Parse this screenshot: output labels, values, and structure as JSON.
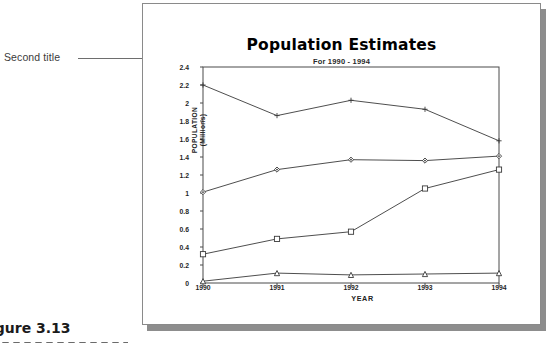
{
  "annotation": {
    "label": "Second title",
    "leader_icon": "arrow-right-icon"
  },
  "figure": {
    "caption": "igure 3.13"
  },
  "chart_data": {
    "type": "line",
    "title": "Population Estimates",
    "subtitle": "For 1990 - 1994",
    "xlabel": "YEAR",
    "ylabel": "POPULATION",
    "ylabel_sub": "(Millions)",
    "categories": [
      "1990",
      "1991",
      "1992",
      "1993",
      "1994"
    ],
    "ylim": [
      0,
      2.4
    ],
    "yticks": [
      "0",
      "0.2",
      "0.4",
      "0.6",
      "0.8",
      "1",
      "1.2",
      "1.4",
      "1.6",
      "1.8",
      "2",
      "2.2",
      "2.4"
    ],
    "ytick_values": [
      0,
      0.2,
      0.4,
      0.6,
      0.8,
      1,
      1.2,
      1.4,
      1.6,
      1.8,
      2,
      2.2,
      2.4
    ],
    "grid": false,
    "legend": "none",
    "series": [
      {
        "name": "Series 1",
        "marker": "plus",
        "values": [
          2.2,
          1.86,
          2.03,
          1.93,
          1.58
        ]
      },
      {
        "name": "Series 2",
        "marker": "diamond",
        "values": [
          1.01,
          1.26,
          1.37,
          1.36,
          1.41
        ]
      },
      {
        "name": "Series 3",
        "marker": "square",
        "values": [
          0.32,
          0.49,
          0.57,
          1.05,
          1.26
        ]
      },
      {
        "name": "Series 4",
        "marker": "triangle",
        "values": [
          0.02,
          0.11,
          0.09,
          0.1,
          0.11
        ]
      }
    ],
    "colors": {
      "line": "#3a3a3a",
      "frame": "#4a4a4a",
      "text": "#1f1f1f"
    }
  }
}
